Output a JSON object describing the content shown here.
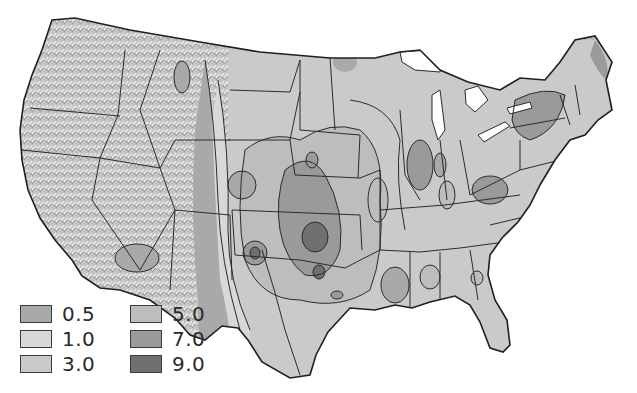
{
  "map": {
    "subject": "Contiguous United States contour map",
    "palette": {
      "background": "#ffffff",
      "outline": "#2b2b2b",
      "relief": "#c9c9c9",
      "level_0_5": "#a9a9a9",
      "level_1_0": "#d8d8d8",
      "level_3_0": "#cacaca",
      "level_5_0": "#bdbdbd",
      "level_7_0": "#9a9a9a",
      "level_9_0": "#707070"
    }
  },
  "legend": {
    "items": [
      {
        "label": "0.5",
        "color": "#a9a9a9"
      },
      {
        "label": "1.0",
        "color": "#d8d8d8"
      },
      {
        "label": "3.0",
        "color": "#cacaca"
      },
      {
        "label": "5.0",
        "color": "#bdbdbd"
      },
      {
        "label": "7.0",
        "color": "#9a9a9a"
      },
      {
        "label": "9.0",
        "color": "#707070"
      }
    ]
  }
}
